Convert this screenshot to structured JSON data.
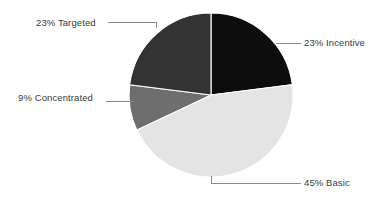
{
  "chart_data": {
    "type": "pie",
    "title": "",
    "labels": [
      "Incentive",
      "Basic",
      "Concentrated",
      "Targeted"
    ],
    "values": [
      23,
      45,
      9,
      23
    ],
    "value_unit": "%",
    "legend": "none",
    "grid": false,
    "slice_colors": [
      "#0d0d0d",
      "#e4e4e4",
      "#6e6e6e",
      "#333333"
    ],
    "separator_color": "#ffffff",
    "background_color": "#ffffff",
    "label_color": "#3a3a3a",
    "leader_line_color": "#8a8a8a",
    "slices": [
      {
        "name": "Incentive",
        "percent": 23,
        "label_text": "23% Incentive",
        "color": "#0d0d0d",
        "start_angle_deg": 0,
        "end_angle_deg": 82.8
      },
      {
        "name": "Basic",
        "percent": 45,
        "label_text": "45% Basic",
        "color": "#e4e4e4",
        "start_angle_deg": 82.8,
        "end_angle_deg": 244.8
      },
      {
        "name": "Concentrated",
        "percent": 9,
        "label_text": "9% Concentrated",
        "color": "#6e6e6e",
        "start_angle_deg": 244.8,
        "end_angle_deg": 277.2
      },
      {
        "name": "Targeted",
        "percent": 23,
        "label_text": "23% Targeted",
        "color": "#333333",
        "start_angle_deg": 277.2,
        "end_angle_deg": 360
      }
    ]
  },
  "labels": {
    "targeted": "23% Targeted",
    "incentive": "23% Incentive",
    "concentrated": "9% Concentrated",
    "basic": "45% Basic"
  }
}
